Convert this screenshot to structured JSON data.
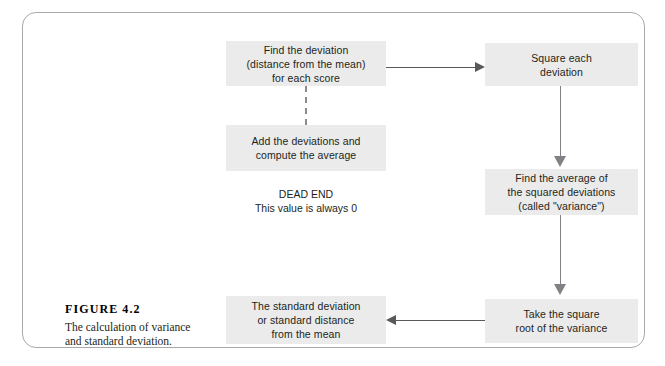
{
  "figure": {
    "number": "FIGURE 4.2",
    "description": "The calculation of variance\nand standard deviation."
  },
  "diagram": {
    "type": "flowchart",
    "nodes": [
      {
        "id": "deviation",
        "label": "Find the deviation\n(distance from the mean)\nfor each score"
      },
      {
        "id": "square",
        "label": "Square each\ndeviation"
      },
      {
        "id": "add",
        "label": "Add the deviations and\ncompute the average"
      },
      {
        "id": "variance",
        "label": "Find the average of\nthe squared deviations\n(called \"variance\")"
      },
      {
        "id": "sqrt",
        "label": "Take the square\nroot of the variance"
      },
      {
        "id": "stddev",
        "label": "The standard deviation\nor standard distance\nfrom the mean"
      }
    ],
    "annotations": {
      "dead_end": "DEAD END\nThis value is always 0"
    },
    "colors": {
      "box_fill": "#ebebeb",
      "text": "#231f20",
      "arrow": "#58595b",
      "arrow_vertical": "#808285",
      "dashed_connector": "#8c8c8c",
      "frame_border": "#a9a9a9",
      "background": "#ffffff"
    }
  }
}
